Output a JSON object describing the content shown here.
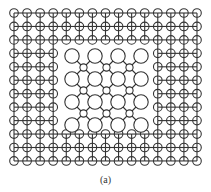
{
  "figure": {
    "caption": "(a)",
    "stroke_color": "#333333",
    "background": "#ffffff",
    "outer_grid": {
      "columns": 15,
      "rows": 12,
      "x_start": 14,
      "x_step": 13.07,
      "y_start": 13,
      "y_step": 13.45,
      "node_radius": 4.3,
      "hole": {
        "col_start": 4,
        "col_end": 10,
        "row_start": 3,
        "row_end": 8
      }
    },
    "inner_lattice": {
      "big_nodes": {
        "x": [
          72,
          95,
          118,
          141
        ],
        "y": [
          56,
          79,
          102,
          125
        ],
        "radius": 7.2
      },
      "small_nodes": {
        "x": [
          83.5,
          106.5,
          129.5
        ],
        "y": [
          67.5,
          90.5,
          113.5
        ],
        "radius": 3.6
      }
    }
  }
}
